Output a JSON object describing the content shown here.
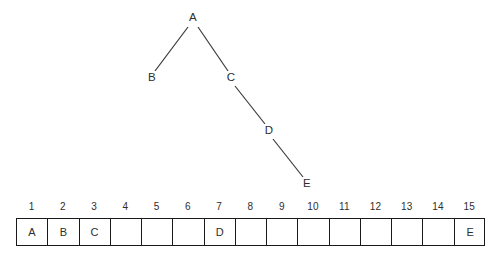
{
  "figure": {
    "kind": "binary-tree-and-array-representation",
    "colors": {
      "background": "#ffffff",
      "ink": "#2e2e2e",
      "stroke": "#1a1a1a"
    },
    "tree": {
      "nodes": [
        {
          "id": "A",
          "label": "A",
          "x": 193,
          "y": 18
        },
        {
          "id": "B",
          "label": "B",
          "x": 152,
          "y": 78
        },
        {
          "id": "C",
          "label": "C",
          "x": 231,
          "y": 78
        },
        {
          "id": "D",
          "label": "D",
          "x": 269,
          "y": 131
        },
        {
          "id": "E",
          "label": "E",
          "x": 307,
          "y": 184
        }
      ],
      "edges": [
        {
          "from": "A",
          "to": "B"
        },
        {
          "from": "A",
          "to": "C"
        },
        {
          "from": "C",
          "to": "D"
        },
        {
          "from": "D",
          "to": "E"
        }
      ]
    },
    "array": {
      "indices": [
        "1",
        "2",
        "3",
        "4",
        "5",
        "6",
        "7",
        "8",
        "9",
        "10",
        "11",
        "12",
        "13",
        "14",
        "15"
      ],
      "cells": [
        "A",
        "B",
        "C",
        "",
        "",
        "",
        "D",
        "",
        "",
        "",
        "",
        "",
        "",
        "",
        "E"
      ]
    }
  }
}
